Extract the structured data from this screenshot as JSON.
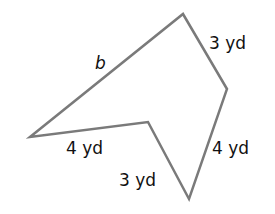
{
  "figure": {
    "type": "polygon",
    "stroke_color": "#7a7a7a",
    "text_color": "#111111",
    "side_labels": {
      "top_left": "b",
      "top_right": "3 yd",
      "right": "4 yd",
      "bottom_inner": "3 yd",
      "bottom_left": "4 yd"
    }
  }
}
